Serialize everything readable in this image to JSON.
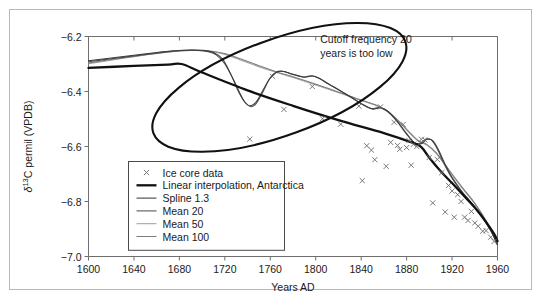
{
  "figure": {
    "frame_border_color": "#b9b9b9",
    "background": "#ffffff"
  },
  "chart_data": {
    "type": "line",
    "title": "",
    "xlabel": "Years AD",
    "ylabel": "δ¹³C permil (VPDB)",
    "ylabel_parts": {
      "delta": "δ",
      "sup": "13",
      "rest": "C permil (VPDB)"
    },
    "xlim": [
      1600,
      1960
    ],
    "ylim": [
      -7.0,
      -6.2
    ],
    "xticks": [
      1600,
      1640,
      1680,
      1720,
      1760,
      1800,
      1840,
      1880,
      1920,
      1960
    ],
    "xtick_labels": [
      "1600",
      "1640",
      "1680",
      "1720",
      "1760",
      "1800",
      "1840",
      "1880",
      "1920",
      "1960"
    ],
    "yticks": [
      -6.2,
      -6.4,
      -6.6,
      -6.8,
      -7.0
    ],
    "ytick_labels": [
      "−6.2",
      "−6.4",
      "−6.6",
      "−6.8",
      "−7.0"
    ],
    "grid": false,
    "legend_position": "lower-left",
    "annotations": [
      {
        "name": "cutoff-frequency-note",
        "lines": [
          "Cutoff frequency 20",
          "years is too low"
        ],
        "x": 1804,
        "y": -6.225
      },
      {
        "name": "highlight-ellipse",
        "shape": "ellipse",
        "cx": 1768,
        "cy": -6.385,
        "rx": 118,
        "ry": 0.175,
        "rotation_deg": -20,
        "color": "#111111"
      }
    ],
    "series": [
      {
        "name": "Ice core data",
        "key": "ice_core_data",
        "type": "scatter",
        "marker": "x",
        "color": "#6b6b6b",
        "points": [
          [
            1762,
            -6.345
          ],
          [
            1772,
            -6.465
          ],
          [
            1797,
            -6.382
          ],
          [
            1742,
            -6.573
          ],
          [
            1806,
            -6.499
          ],
          [
            1822,
            -6.519
          ],
          [
            1838,
            -6.453
          ],
          [
            1841,
            -6.724
          ],
          [
            1845,
            -6.597
          ],
          [
            1849,
            -6.613
          ],
          [
            1852,
            -6.648
          ],
          [
            1857,
            -6.456
          ],
          [
            1862,
            -6.672
          ],
          [
            1866,
            -6.585
          ],
          [
            1869,
            -6.512
          ],
          [
            1872,
            -6.596
          ],
          [
            1874,
            -6.61
          ],
          [
            1877,
            -6.52
          ],
          [
            1880,
            -6.604
          ],
          [
            1882,
            -6.578
          ],
          [
            1884,
            -6.668
          ],
          [
            1886,
            -6.592
          ],
          [
            1889,
            -6.6
          ],
          [
            1893,
            -6.574
          ],
          [
            1896,
            -6.576
          ],
          [
            1900,
            -6.64
          ],
          [
            1903,
            -6.805
          ],
          [
            1907,
            -6.647
          ],
          [
            1911,
            -6.695
          ],
          [
            1914,
            -6.838
          ],
          [
            1917,
            -6.742
          ],
          [
            1920,
            -6.762
          ],
          [
            1922,
            -6.857
          ],
          [
            1925,
            -6.775
          ],
          [
            1928,
            -6.8
          ],
          [
            1931,
            -6.857
          ],
          [
            1934,
            -6.869
          ],
          [
            1937,
            -6.836
          ],
          [
            1940,
            -6.878
          ],
          [
            1943,
            -6.89
          ],
          [
            1947,
            -6.908
          ],
          [
            1950,
            -6.906
          ],
          [
            1954,
            -6.93
          ],
          [
            1957,
            -6.945
          ]
        ]
      },
      {
        "name": "Linear interpolation, Antarctica",
        "key": "linear_interpolation",
        "type": "line",
        "color": "#111111",
        "width": 2.3,
        "points": [
          [
            1600,
            -6.314
          ],
          [
            1640,
            -6.307
          ],
          [
            1670,
            -6.302
          ],
          [
            1682,
            -6.3
          ],
          [
            1700,
            -6.331
          ],
          [
            1740,
            -6.396
          ],
          [
            1780,
            -6.452
          ],
          [
            1820,
            -6.504
          ],
          [
            1860,
            -6.551
          ],
          [
            1885,
            -6.586
          ],
          [
            1893,
            -6.602
          ],
          [
            1900,
            -6.641
          ],
          [
            1910,
            -6.69
          ],
          [
            1920,
            -6.733
          ],
          [
            1930,
            -6.777
          ],
          [
            1940,
            -6.822
          ],
          [
            1950,
            -6.875
          ],
          [
            1957,
            -6.918
          ],
          [
            1960,
            -6.944
          ]
        ]
      },
      {
        "name": "Spline 1.3",
        "key": "spline_13",
        "type": "line",
        "color": "#3b3b3b",
        "width": 1.05,
        "points": [
          [
            1600,
            -6.288
          ],
          [
            1620,
            -6.278
          ],
          [
            1640,
            -6.268
          ],
          [
            1660,
            -6.258
          ],
          [
            1675,
            -6.252
          ],
          [
            1690,
            -6.249
          ],
          [
            1700,
            -6.25
          ],
          [
            1710,
            -6.258
          ],
          [
            1718,
            -6.282
          ],
          [
            1725,
            -6.335
          ],
          [
            1732,
            -6.4
          ],
          [
            1738,
            -6.441
          ],
          [
            1743,
            -6.452
          ],
          [
            1748,
            -6.436
          ],
          [
            1754,
            -6.392
          ],
          [
            1760,
            -6.35
          ],
          [
            1766,
            -6.329
          ],
          [
            1772,
            -6.327
          ],
          [
            1780,
            -6.338
          ],
          [
            1790,
            -6.348
          ],
          [
            1797,
            -6.344
          ],
          [
            1803,
            -6.352
          ],
          [
            1812,
            -6.374
          ],
          [
            1822,
            -6.398
          ],
          [
            1832,
            -6.423
          ],
          [
            1842,
            -6.449
          ],
          [
            1850,
            -6.464
          ],
          [
            1857,
            -6.459
          ],
          [
            1864,
            -6.473
          ],
          [
            1872,
            -6.509
          ],
          [
            1880,
            -6.553
          ],
          [
            1887,
            -6.586
          ],
          [
            1893,
            -6.59
          ],
          [
            1898,
            -6.574
          ],
          [
            1903,
            -6.579
          ],
          [
            1908,
            -6.612
          ],
          [
            1914,
            -6.666
          ],
          [
            1920,
            -6.712
          ],
          [
            1928,
            -6.76
          ],
          [
            1936,
            -6.8
          ],
          [
            1944,
            -6.84
          ],
          [
            1952,
            -6.889
          ],
          [
            1957,
            -6.93
          ],
          [
            1960,
            -6.958
          ]
        ]
      },
      {
        "name": "Mean 20",
        "key": "mean_20",
        "type": "line",
        "color": "#4f4f4f",
        "width": 1.05,
        "points": [
          [
            1600,
            -6.292
          ],
          [
            1620,
            -6.281
          ],
          [
            1640,
            -6.271
          ],
          [
            1660,
            -6.261
          ],
          [
            1675,
            -6.253
          ],
          [
            1690,
            -6.25
          ],
          [
            1702,
            -6.253
          ],
          [
            1712,
            -6.266
          ],
          [
            1720,
            -6.3
          ],
          [
            1728,
            -6.36
          ],
          [
            1736,
            -6.428
          ],
          [
            1742,
            -6.454
          ],
          [
            1747,
            -6.447
          ],
          [
            1753,
            -6.406
          ],
          [
            1759,
            -6.357
          ],
          [
            1765,
            -6.33
          ],
          [
            1771,
            -6.326
          ],
          [
            1779,
            -6.336
          ],
          [
            1789,
            -6.347
          ],
          [
            1796,
            -6.343
          ],
          [
            1802,
            -6.35
          ],
          [
            1811,
            -6.372
          ],
          [
            1821,
            -6.396
          ],
          [
            1831,
            -6.421
          ],
          [
            1841,
            -6.446
          ],
          [
            1849,
            -6.462
          ],
          [
            1856,
            -6.458
          ],
          [
            1863,
            -6.471
          ],
          [
            1871,
            -6.506
          ],
          [
            1879,
            -6.55
          ],
          [
            1886,
            -6.584
          ],
          [
            1892,
            -6.589
          ],
          [
            1897,
            -6.573
          ],
          [
            1902,
            -6.577
          ],
          [
            1907,
            -6.609
          ],
          [
            1913,
            -6.663
          ],
          [
            1919,
            -6.709
          ],
          [
            1927,
            -6.757
          ],
          [
            1935,
            -6.797
          ],
          [
            1943,
            -6.837
          ],
          [
            1951,
            -6.886
          ],
          [
            1957,
            -6.928
          ],
          [
            1960,
            -6.956
          ]
        ]
      },
      {
        "name": "Mean 50",
        "key": "mean_50",
        "type": "line",
        "color": "#a0a0a0",
        "width": 1.05,
        "points": [
          [
            1600,
            -6.299
          ],
          [
            1625,
            -6.283
          ],
          [
            1650,
            -6.267
          ],
          [
            1670,
            -6.257
          ],
          [
            1690,
            -6.251
          ],
          [
            1705,
            -6.253
          ],
          [
            1720,
            -6.265
          ],
          [
            1735,
            -6.287
          ],
          [
            1750,
            -6.31
          ],
          [
            1765,
            -6.33
          ],
          [
            1780,
            -6.349
          ],
          [
            1795,
            -6.369
          ],
          [
            1810,
            -6.39
          ],
          [
            1825,
            -6.411
          ],
          [
            1840,
            -6.433
          ],
          [
            1852,
            -6.449
          ],
          [
            1862,
            -6.47
          ],
          [
            1872,
            -6.505
          ],
          [
            1882,
            -6.548
          ],
          [
            1890,
            -6.58
          ],
          [
            1898,
            -6.596
          ],
          [
            1906,
            -6.625
          ],
          [
            1914,
            -6.669
          ],
          [
            1922,
            -6.714
          ],
          [
            1930,
            -6.757
          ],
          [
            1938,
            -6.797
          ],
          [
            1946,
            -6.845
          ],
          [
            1953,
            -6.895
          ],
          [
            1960,
            -6.96
          ]
        ]
      },
      {
        "name": "Mean 100",
        "key": "mean_100",
        "type": "line",
        "color": "#7d7d7d",
        "width": 1.05,
        "points": [
          [
            1600,
            -6.296
          ],
          [
            1625,
            -6.281
          ],
          [
            1650,
            -6.266
          ],
          [
            1670,
            -6.256
          ],
          [
            1690,
            -6.25
          ],
          [
            1705,
            -6.252
          ],
          [
            1720,
            -6.262
          ],
          [
            1735,
            -6.283
          ],
          [
            1750,
            -6.306
          ],
          [
            1765,
            -6.328
          ],
          [
            1780,
            -6.346
          ],
          [
            1795,
            -6.366
          ],
          [
            1810,
            -6.387
          ],
          [
            1825,
            -6.409
          ],
          [
            1840,
            -6.431
          ],
          [
            1852,
            -6.447
          ],
          [
            1862,
            -6.468
          ],
          [
            1872,
            -6.503
          ],
          [
            1882,
            -6.546
          ],
          [
            1890,
            -6.578
          ],
          [
            1898,
            -6.593
          ],
          [
            1906,
            -6.622
          ],
          [
            1914,
            -6.666
          ],
          [
            1922,
            -6.711
          ],
          [
            1930,
            -6.754
          ],
          [
            1938,
            -6.795
          ],
          [
            1946,
            -6.843
          ],
          [
            1953,
            -6.893
          ],
          [
            1960,
            -6.957
          ]
        ]
      }
    ],
    "legend": {
      "items": [
        {
          "label": "Ice core data",
          "marker": "x",
          "color": "#6b6b6b",
          "width": 0
        },
        {
          "label": "Linear interpolation, Antarctica",
          "marker": "line",
          "color": "#111111",
          "width": 2.3
        },
        {
          "label": "Spline 1.3",
          "marker": "line",
          "color": "#3b3b3b",
          "width": 1.05
        },
        {
          "label": "Mean 20",
          "marker": "line",
          "color": "#4f4f4f",
          "width": 1.05
        },
        {
          "label": "Mean 50",
          "marker": "line",
          "color": "#a0a0a0",
          "width": 1.05
        },
        {
          "label": "Mean 100",
          "marker": "line",
          "color": "#7d7d7d",
          "width": 1.05
        }
      ]
    }
  }
}
